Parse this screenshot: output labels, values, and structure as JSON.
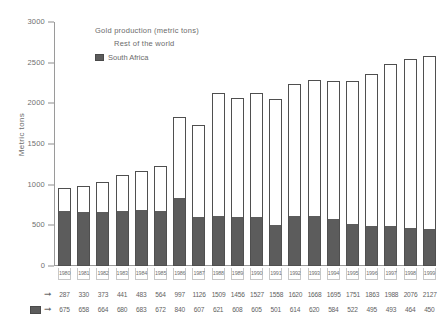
{
  "chart_data": {
    "type": "bar",
    "title": "Gold production (metric tons)",
    "xlabel": "",
    "ylabel": "Metric tons",
    "ylim": [
      0,
      3000
    ],
    "yticks": [
      0,
      500,
      1000,
      1500,
      2000,
      2500,
      3000
    ],
    "ytick_labels": [
      "0",
      "500",
      "1000",
      "1500",
      "2000",
      "2500",
      "3000"
    ],
    "grid": false,
    "stacked": true,
    "legend_position": "upper-left-inside",
    "categories": [
      "1980",
      "1981",
      "1982",
      "1983",
      "1984",
      "1985",
      "1986",
      "1987",
      "1988",
      "1989",
      "1990",
      "1991",
      "1992",
      "1993",
      "1994",
      "1995",
      "1996",
      "1997",
      "1998",
      "1999"
    ],
    "series": [
      {
        "name": "Rest of the world",
        "color": "#ffffff",
        "edge_color": "#4f4f4f",
        "values": [
          287,
          330,
          373,
          441,
          483,
          564,
          997,
          1126,
          1509,
          1456,
          1527,
          1558,
          1620,
          1668,
          1695,
          1751,
          1863,
          1988,
          2076,
          2127
        ]
      },
      {
        "name": "South Africa",
        "color": "#5c5c5c",
        "edge_color": "#4f4f4f",
        "values": [
          675,
          658,
          664,
          680,
          683,
          672,
          840,
          607,
          621,
          608,
          605,
          501,
          614,
          620,
          584,
          522,
          495,
          493,
          464,
          450
        ]
      }
    ]
  },
  "legend": {
    "title": "Gold production (metric tons)",
    "rest_label": "Rest of the world",
    "south_africa_label": "South Africa"
  },
  "axes": {
    "y_title": "Metric tons"
  },
  "data_rows": {
    "arrow_glyph": "➞"
  }
}
